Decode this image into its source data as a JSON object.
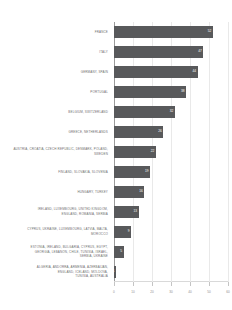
{
  "chart_data": {
    "type": "bar",
    "orientation": "horizontal",
    "title": "",
    "subtitle": "",
    "xlabel": "",
    "ylabel": "",
    "xlim": [
      0,
      60
    ],
    "grid": true,
    "legend": null,
    "bar_color": "#58595b",
    "value_labels_inside": true,
    "xticks": [
      0,
      10,
      20,
      30,
      40,
      50,
      60
    ],
    "xticklabels": [
      "0",
      "10",
      "20",
      "30",
      "40",
      "50",
      "60"
    ],
    "categories": [
      "FRANCE",
      "ITALY",
      "GERMANY, SPAIN",
      "PORTUGAL",
      "BELGIUM, SWITZERLAND",
      "GREECE, NETHERLANDS",
      "AUSTRIA, CROATIA, CZECH REPUBLIC, DENMARK, POLAND,\nSWEDEN",
      "FINLAND, SLOVAKIA, SLOVENIA",
      "HUNGARY, TURKEY",
      "IRELAND, LUXEMBOURG, UNITED KINGDOM,\nENGLAND, ROMANIA, SERBIA",
      "CYPRUS, UKRAINE, LUXEMBOURG, LATVIA, MALTA,\nMOROCCO",
      "ESTONIA, IRELAND, BULGARIA, CYPRUS, EGYPT,\nGEORGIA, LEBANON, CHILE, TUNISIA, ISRAEL,\nSERBIA, UKRAINE",
      "ALGERIA, ANDORRA, ARMENIA, AZERBAIJAN,\nENGLAND, ICELAND, MOLDOVA,\nTUNISIA, AUSTRALIA"
    ],
    "values": [
      52,
      47,
      44,
      38,
      32,
      26,
      22,
      19,
      16,
      13,
      9,
      5,
      1
    ],
    "value_label_text": [
      "52",
      "47",
      "44",
      "38",
      "32",
      "26",
      "22",
      "19",
      "16",
      "13",
      "9",
      "5",
      "1"
    ]
  }
}
